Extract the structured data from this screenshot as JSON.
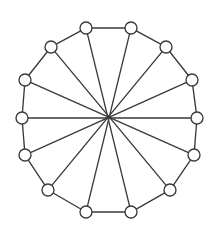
{
  "figure": {
    "kind": "graph-diagram",
    "background_color": "#ffffff",
    "line_color": "#3a3a3a",
    "vertex_fill_color": "#ffffff",
    "vertex_radius": 6,
    "line_width": 1.35,
    "canvas": {
      "width": 218,
      "height": 228
    }
  },
  "chart_data": {
    "type": "graph",
    "layout": "circular",
    "center": {
      "x": 109,
      "y": 120
    },
    "radius": 93,
    "node_count": 14,
    "edge_count": 21,
    "degree": 3,
    "nodes": [
      {
        "id": 0,
        "label": "v0",
        "x": 86,
        "y": 28
      },
      {
        "id": 1,
        "label": "v1",
        "x": 131,
        "y": 28
      },
      {
        "id": 2,
        "label": "v2",
        "x": 166,
        "y": 47
      },
      {
        "id": 3,
        "label": "v3",
        "x": 192,
        "y": 80
      },
      {
        "id": 4,
        "label": "v4",
        "x": 197,
        "y": 118
      },
      {
        "id": 5,
        "label": "v5",
        "x": 194,
        "y": 155
      },
      {
        "id": 6,
        "label": "v6",
        "x": 170,
        "y": 190
      },
      {
        "id": 7,
        "label": "v7",
        "x": 131,
        "y": 212
      },
      {
        "id": 8,
        "label": "v8",
        "x": 86,
        "y": 212
      },
      {
        "id": 9,
        "label": "v9",
        "x": 48,
        "y": 190
      },
      {
        "id": 10,
        "label": "v10",
        "x": 25,
        "y": 155
      },
      {
        "id": 11,
        "label": "v11",
        "x": 22,
        "y": 118
      },
      {
        "id": 12,
        "label": "v12",
        "x": 25,
        "y": 80
      },
      {
        "id": 13,
        "label": "v13",
        "x": 51,
        "y": 47
      }
    ],
    "edges": [
      {
        "source": 0,
        "target": 1,
        "type": "cycle"
      },
      {
        "source": 1,
        "target": 2,
        "type": "cycle"
      },
      {
        "source": 2,
        "target": 3,
        "type": "cycle"
      },
      {
        "source": 3,
        "target": 4,
        "type": "cycle"
      },
      {
        "source": 4,
        "target": 5,
        "type": "cycle"
      },
      {
        "source": 5,
        "target": 6,
        "type": "cycle"
      },
      {
        "source": 6,
        "target": 7,
        "type": "cycle"
      },
      {
        "source": 7,
        "target": 8,
        "type": "cycle"
      },
      {
        "source": 8,
        "target": 9,
        "type": "cycle"
      },
      {
        "source": 9,
        "target": 10,
        "type": "cycle"
      },
      {
        "source": 10,
        "target": 11,
        "type": "cycle"
      },
      {
        "source": 11,
        "target": 12,
        "type": "cycle"
      },
      {
        "source": 12,
        "target": 13,
        "type": "cycle"
      },
      {
        "source": 13,
        "target": 0,
        "type": "cycle"
      },
      {
        "source": 0,
        "target": 7,
        "type": "chord"
      },
      {
        "source": 1,
        "target": 8,
        "type": "chord"
      },
      {
        "source": 2,
        "target": 9,
        "type": "chord"
      },
      {
        "source": 3,
        "target": 10,
        "type": "chord"
      },
      {
        "source": 4,
        "target": 11,
        "type": "chord"
      },
      {
        "source": 5,
        "target": 12,
        "type": "chord"
      },
      {
        "source": 6,
        "target": 13,
        "type": "chord"
      }
    ]
  }
}
